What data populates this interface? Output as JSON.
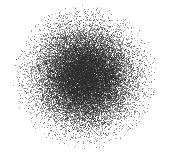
{
  "figure": {
    "title": "",
    "subtitle": "",
    "background_color": "#ffffff",
    "width": 169,
    "height": 161,
    "has_axes": false,
    "has_frame": false,
    "has_gridlines": false,
    "has_legend": false,
    "has_tick_labels": false
  },
  "chart_data": {
    "type": "scatter",
    "title": "",
    "xlabel": "",
    "ylabel": "",
    "xlim": [
      0,
      169
    ],
    "ylim": [
      0,
      161
    ],
    "grid": false,
    "legend": null,
    "legend_position": null,
    "annotations": [],
    "marker": {
      "shape": "point",
      "size_px": 1,
      "color": "#2a2a2a",
      "opacity": 0.5,
      "edge_color": "none"
    },
    "distribution": {
      "kind": "gaussian-2d",
      "n_points": 26000,
      "center_x": 85,
      "center_y": 77,
      "sigma_x": 23,
      "sigma_y": 23,
      "correlation": 0.0,
      "radial_cutoff": 72
    },
    "density_profile": {
      "description": "Radially symmetric point cloud: saturated dark-gray core fading smoothly to white halo.",
      "radii_px": [
        0,
        10,
        20,
        30,
        40,
        50,
        60,
        70
      ],
      "mean_gray_level": [
        "#6a6a6a",
        "#777777",
        "#959595",
        "#b8b8b8",
        "#d6d6d6",
        "#eaeaea",
        "#f6f6f6",
        "#ffffff"
      ],
      "approx_fill_fraction": [
        0.62,
        0.55,
        0.4,
        0.25,
        0.13,
        0.06,
        0.02,
        0.0
      ]
    },
    "series": [
      {
        "name": "points",
        "color": "#2a2a2a",
        "n": 26000
      }
    ],
    "extents": {
      "left_px": 22,
      "right_px": 152,
      "top_px": 16,
      "bottom_px": 143
    }
  },
  "render": {
    "seed": 20240517,
    "core_color": "#2a2a2a",
    "canvas_background": "#ffffff"
  }
}
